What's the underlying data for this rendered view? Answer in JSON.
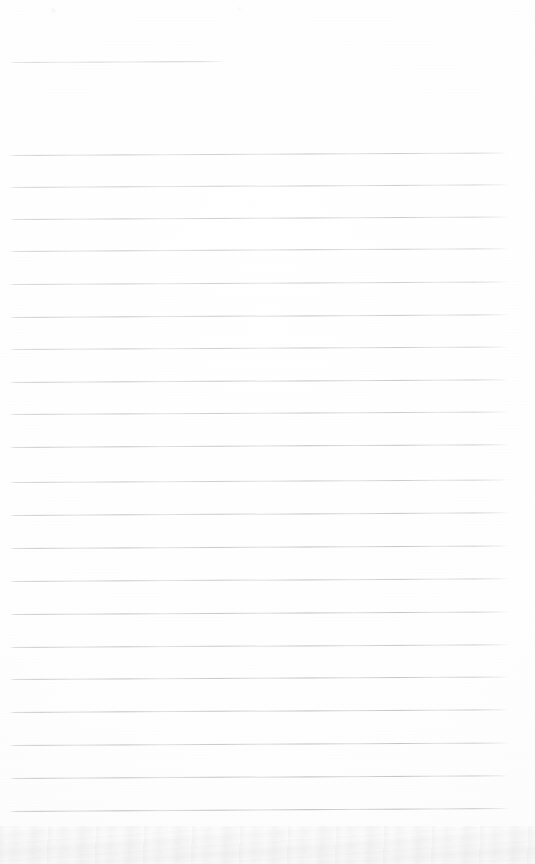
{
  "document": {
    "kind": "scanned-ruled-notebook-page",
    "title": "",
    "body_text": "",
    "page_width": 535,
    "page_height": 864,
    "background_color": "#fefefe",
    "rule_color": "#8e9198",
    "is_blank": true,
    "visible_text": []
  },
  "ruled_lines": {
    "count": 22,
    "left_x": 9,
    "right_x": 508,
    "spacing": 32.6,
    "first_line_y": 62,
    "last_line_y": 811,
    "items": [
      {
        "y": 62,
        "left": 10,
        "width": 215,
        "slant": -0.25,
        "opacity": 0.6,
        "short": true
      },
      {
        "y": 155,
        "left": 9,
        "width": 498,
        "slant": -0.3,
        "opacity": 0.72,
        "short": false
      },
      {
        "y": 187,
        "left": 9,
        "width": 499,
        "slant": -0.32,
        "opacity": 0.7,
        "short": false
      },
      {
        "y": 219,
        "left": 9,
        "width": 499,
        "slant": -0.3,
        "opacity": 0.74,
        "short": false
      },
      {
        "y": 251,
        "left": 9,
        "width": 499,
        "slant": -0.33,
        "opacity": 0.72,
        "short": false
      },
      {
        "y": 284,
        "left": 9,
        "width": 499,
        "slant": -0.3,
        "opacity": 0.7,
        "short": false
      },
      {
        "y": 317,
        "left": 9,
        "width": 499,
        "slant": -0.32,
        "opacity": 0.76,
        "short": false
      },
      {
        "y": 349,
        "left": 9,
        "width": 499,
        "slant": -0.3,
        "opacity": 0.72,
        "short": false
      },
      {
        "y": 382,
        "left": 9,
        "width": 499,
        "slant": -0.32,
        "opacity": 0.78,
        "short": false
      },
      {
        "y": 414,
        "left": 9,
        "width": 499,
        "slant": -0.3,
        "opacity": 0.74,
        "short": false
      },
      {
        "y": 447,
        "left": 9,
        "width": 499,
        "slant": -0.33,
        "opacity": 0.8,
        "short": false
      },
      {
        "y": 482,
        "left": 9,
        "width": 499,
        "slant": -0.3,
        "opacity": 0.72,
        "short": false
      },
      {
        "y": 515,
        "left": 9,
        "width": 499,
        "slant": -0.32,
        "opacity": 0.78,
        "short": false
      },
      {
        "y": 548,
        "left": 9,
        "width": 499,
        "slant": -0.3,
        "opacity": 0.8,
        "short": false
      },
      {
        "y": 581,
        "left": 9,
        "width": 499,
        "slant": -0.32,
        "opacity": 0.76,
        "short": false
      },
      {
        "y": 614,
        "left": 9,
        "width": 499,
        "slant": -0.3,
        "opacity": 0.82,
        "short": false
      },
      {
        "y": 647,
        "left": 9,
        "width": 499,
        "slant": -0.32,
        "opacity": 0.78,
        "short": false
      },
      {
        "y": 679,
        "left": 9,
        "width": 499,
        "slant": -0.3,
        "opacity": 0.8,
        "short": false
      },
      {
        "y": 712,
        "left": 9,
        "width": 499,
        "slant": -0.32,
        "opacity": 0.82,
        "short": false
      },
      {
        "y": 745,
        "left": 9,
        "width": 499,
        "slant": -0.3,
        "opacity": 0.8,
        "short": false
      },
      {
        "y": 778,
        "left": 9,
        "width": 499,
        "slant": -0.32,
        "opacity": 0.84,
        "short": false
      },
      {
        "y": 811,
        "left": 9,
        "width": 499,
        "slant": -0.34,
        "opacity": 0.88,
        "short": false
      }
    ]
  },
  "artifacts": {
    "bottom_smudge": {
      "top": 826,
      "height": 38
    },
    "specks": [
      {
        "x": 52,
        "y": 9,
        "size": 3
      },
      {
        "x": 238,
        "y": 8,
        "size": 2
      }
    ]
  }
}
